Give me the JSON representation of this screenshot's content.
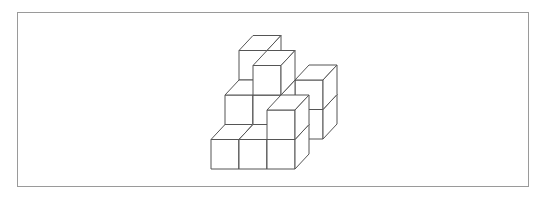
{
  "figure": {
    "title": "",
    "line_color": "#555555",
    "fill_color": "#ffffff",
    "border_color": "#9a9a9a",
    "cubes": [
      {
        "x": 0,
        "y": 0,
        "z": 2
      },
      {
        "x": 0,
        "y": 1,
        "z": 2
      },
      {
        "x": 0,
        "y": 2,
        "z": 2
      },
      {
        "x": 2,
        "y": 0,
        "z": 2
      },
      {
        "x": 2,
        "y": 1,
        "z": 2
      },
      {
        "x": 1,
        "y": 0,
        "z": 1
      },
      {
        "x": 1,
        "y": 1,
        "z": 1
      },
      {
        "x": 1,
        "y": 2,
        "z": 1
      },
      {
        "x": 0,
        "y": 0,
        "z": 1
      },
      {
        "x": 0,
        "y": 1,
        "z": 1
      },
      {
        "x": 0,
        "y": 0,
        "z": 0
      },
      {
        "x": 1,
        "y": 0,
        "z": 0
      },
      {
        "x": 2,
        "y": 0,
        "z": 0
      },
      {
        "x": 2,
        "y": 1,
        "z": 0
      }
    ]
  }
}
